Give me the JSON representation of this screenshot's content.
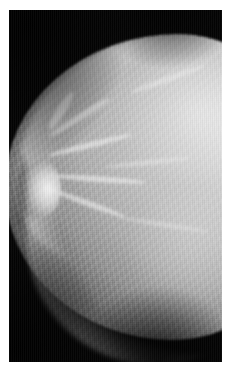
{
  "viewer": {
    "name": "radiograph-viewer",
    "kind": "medical-image",
    "modality": "Mammography",
    "view": "CC (cranio-caudal)",
    "laterality_hint": "chest wall at right edge, nipple in profile at left",
    "alt_text": "Grayscale mammogram showing breast tissue in profile against a black background, with the nipple at the left and dense fibroglandular tissue filling the right portion of the frame."
  },
  "frame": {
    "width_px": 235,
    "height_px": 375,
    "border_color": "#ffffff",
    "border_width_px": 9,
    "field_color": "#040404",
    "field_width_px": 213,
    "field_height_px": 352
  },
  "palette": {
    "background_black": "#040404",
    "skin_line": "#f8f8f8",
    "fat_gray": "#8e8e8e",
    "parenchyma_mid": "#bcbcbc",
    "parenchyma_bright": "#e2e2e2",
    "highlight_white": "#efefef",
    "mount_white": "#ffffff"
  },
  "regions": [
    {
      "name": "background",
      "label": "Air / background",
      "tone": "#040404"
    },
    {
      "name": "skin-line-upper",
      "label": "Superior skin line",
      "tone": "#f0f0f0"
    },
    {
      "name": "skin-line-lower",
      "label": "Inferior skin line",
      "tone": "#d8d8d8"
    },
    {
      "name": "nipple",
      "label": "Nipple in profile",
      "tone": "#f4f4f4"
    },
    {
      "name": "subareolar",
      "label": "Retroareolar region",
      "tone": "#cfcfcf"
    },
    {
      "name": "parenchyma",
      "label": "Fibroglandular parenchyma",
      "tone": "#c4c4c4"
    },
    {
      "name": "dense-core",
      "label": "Dense upper tissue",
      "tone": "#e4e4e4"
    },
    {
      "name": "chest-wall-edge",
      "label": "Chest wall margin (right edge)",
      "tone": "#cccccc"
    }
  ],
  "annotations": {
    "markers": [],
    "text_overlays": [],
    "measurement_labels": []
  }
}
